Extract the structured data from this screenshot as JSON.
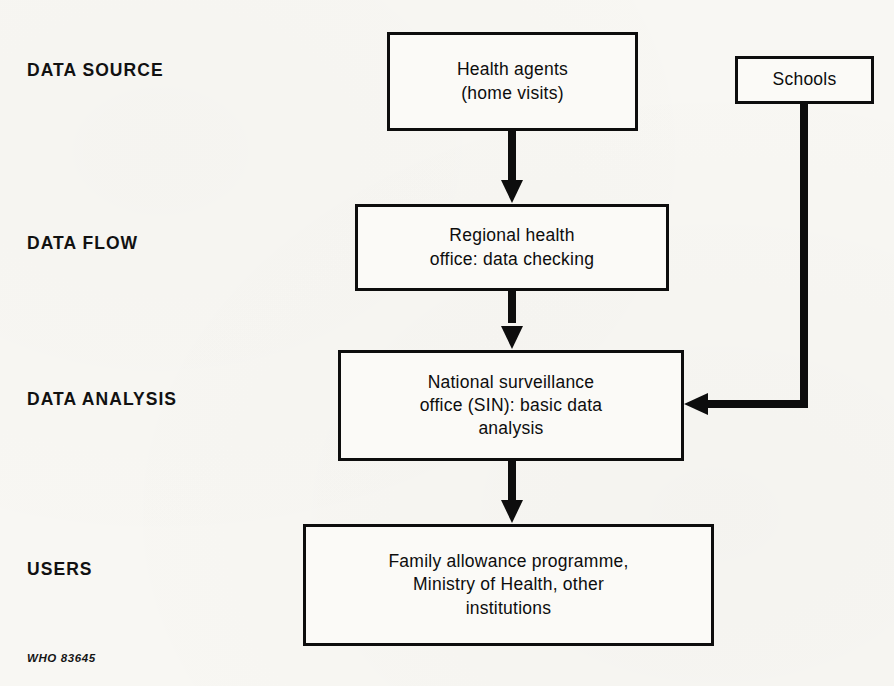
{
  "diagram": {
    "title": "",
    "credit": "WHO 83645",
    "colors": {
      "background": "#f8f7f3",
      "box_fill": "#fbfaf7",
      "stroke": "#0d0d0d",
      "text": "#0d0d0d"
    },
    "stage_labels": [
      {
        "id": "data-source",
        "label": "DATA SOURCE"
      },
      {
        "id": "data-flow",
        "label": "DATA FLOW"
      },
      {
        "id": "data-analysis",
        "label": "DATA ANALYSIS"
      },
      {
        "id": "users",
        "label": "USERS"
      }
    ],
    "nodes": [
      {
        "id": "health-agents",
        "text": "Health agents\n(home visits)"
      },
      {
        "id": "schools",
        "text": "Schools"
      },
      {
        "id": "regional",
        "text": "Regional health\noffice: data checking"
      },
      {
        "id": "national",
        "text": "National surveillance\noffice (SIN): basic data\nanalysis"
      },
      {
        "id": "users",
        "text": "Family allowance programme,\nMinistry of Health, other\ninstitutions"
      }
    ],
    "edges": [
      {
        "id": "health-agents-to-regional",
        "from": "health-agents",
        "to": "regional",
        "direction": "down"
      },
      {
        "id": "regional-to-national",
        "from": "regional",
        "to": "national",
        "direction": "down"
      },
      {
        "id": "national-to-users",
        "from": "national",
        "to": "users",
        "direction": "down"
      },
      {
        "id": "schools-to-national",
        "from": "schools",
        "to": "national",
        "direction": "down-then-left"
      }
    ]
  }
}
